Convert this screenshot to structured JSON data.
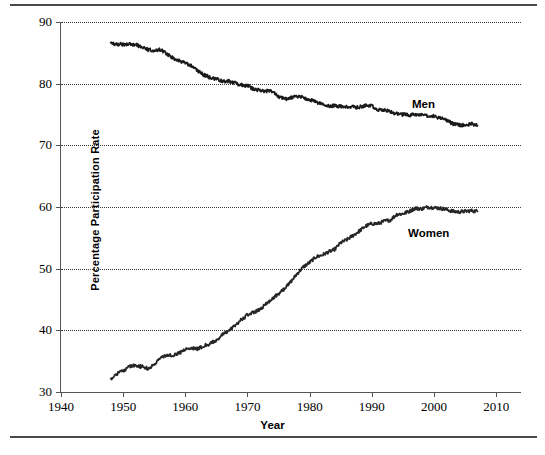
{
  "chart_data": {
    "type": "line",
    "title": "",
    "xlabel": "Year",
    "ylabel": "Percentage Participation Rate",
    "xlim": [
      1940,
      2014
    ],
    "ylim": [
      30,
      90
    ],
    "xticks": [
      1940,
      1950,
      1960,
      1970,
      1980,
      1990,
      2000,
      2010
    ],
    "yticks": [
      30,
      40,
      50,
      60,
      70,
      80,
      90
    ],
    "grid": "horizontal-dotted",
    "legend_position": "inline-annotation",
    "annotations": [
      {
        "text": "Men",
        "x": 2000,
        "y": 77.5
      },
      {
        "text": "Women",
        "x": 1999,
        "y": 56.5
      }
    ],
    "series": [
      {
        "name": "Men",
        "color": "#1a1a1a",
        "x": [
          1948,
          1949,
          1950,
          1951,
          1952,
          1953,
          1954,
          1955,
          1956,
          1957,
          1958,
          1959,
          1960,
          1961,
          1962,
          1963,
          1964,
          1965,
          1966,
          1967,
          1968,
          1969,
          1970,
          1971,
          1972,
          1973,
          1974,
          1975,
          1976,
          1977,
          1978,
          1979,
          1980,
          1981,
          1982,
          1983,
          1984,
          1985,
          1986,
          1987,
          1988,
          1989,
          1990,
          1991,
          1992,
          1993,
          1994,
          1995,
          1996,
          1997,
          1998,
          1999,
          2000,
          2001,
          2002,
          2003,
          2004,
          2005,
          2006,
          2007
        ],
        "values": [
          86.6,
          86.4,
          86.4,
          86.5,
          86.3,
          86.0,
          85.5,
          85.4,
          85.5,
          84.8,
          84.2,
          83.7,
          83.3,
          82.9,
          82.0,
          81.4,
          81.0,
          80.7,
          80.4,
          80.4,
          80.1,
          79.8,
          79.7,
          79.1,
          78.9,
          78.8,
          78.7,
          77.9,
          77.5,
          77.7,
          77.9,
          77.8,
          77.4,
          77.0,
          76.6,
          76.4,
          76.4,
          76.3,
          76.3,
          76.2,
          76.2,
          76.4,
          76.4,
          75.8,
          75.8,
          75.4,
          75.1,
          75.0,
          74.9,
          75.0,
          74.9,
          74.7,
          74.8,
          74.4,
          74.1,
          73.5,
          73.3,
          73.3,
          73.5,
          73.2
        ]
      },
      {
        "name": "Women",
        "color": "#262626",
        "x": [
          1948,
          1949,
          1950,
          1951,
          1952,
          1953,
          1954,
          1955,
          1956,
          1957,
          1958,
          1959,
          1960,
          1961,
          1962,
          1963,
          1964,
          1965,
          1966,
          1967,
          1968,
          1969,
          1970,
          1971,
          1972,
          1973,
          1974,
          1975,
          1976,
          1977,
          1978,
          1979,
          1980,
          1981,
          1982,
          1983,
          1984,
          1985,
          1986,
          1987,
          1988,
          1989,
          1990,
          1991,
          1992,
          1993,
          1994,
          1995,
          1996,
          1997,
          1998,
          1999,
          2000,
          2001,
          2002,
          2003,
          2004,
          2005,
          2006,
          2007
        ],
        "values": [
          32.1,
          33.0,
          33.4,
          34.2,
          34.3,
          34.1,
          33.8,
          34.4,
          35.6,
          35.9,
          36.0,
          36.3,
          36.9,
          37.2,
          37.0,
          37.5,
          37.8,
          38.4,
          39.3,
          39.9,
          40.8,
          41.7,
          42.5,
          42.9,
          43.4,
          44.3,
          45.2,
          45.9,
          46.8,
          47.9,
          49.2,
          50.3,
          51.0,
          51.9,
          52.2,
          52.7,
          53.1,
          54.2,
          54.7,
          55.4,
          56.1,
          56.9,
          57.3,
          57.3,
          57.7,
          57.9,
          58.8,
          58.9,
          59.3,
          59.8,
          59.7,
          60.0,
          59.9,
          59.8,
          59.6,
          59.3,
          59.2,
          59.3,
          59.4,
          59.3
        ]
      }
    ]
  },
  "axis": {
    "y_labels": [
      "90",
      "80",
      "70",
      "60",
      "50",
      "40",
      "30"
    ],
    "x_labels": [
      "1940",
      "1950",
      "1960",
      "1970",
      "1980",
      "1990",
      "2000",
      "2010"
    ],
    "y_title": "Percentage Participation Rate",
    "x_title": "Year"
  },
  "series_labels": {
    "men": "Men",
    "women": "Women"
  }
}
